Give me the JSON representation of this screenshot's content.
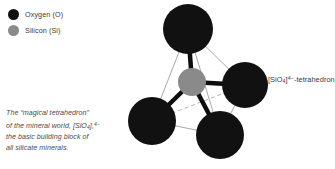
{
  "legend": {
    "items": [
      {
        "label": "Oxygen (O)",
        "color": "#111111",
        "icon": "circle-icon"
      },
      {
        "label": "Silicon (Si)",
        "color": "#8a8a8a",
        "icon": "circle-icon"
      }
    ]
  },
  "caption": {
    "line1": "The “magical tetrahedron”",
    "line2_pre": "of the mineral world, [SiO",
    "line2_sub": "4",
    "line2_sup": "4−",
    "line2_post": "],",
    "line3": "the basic building block of",
    "line4": "all silicate minerals."
  },
  "right_label": {
    "pre": "[SiO",
    "sub": "4",
    "sup": "4−",
    "post": "]-tetrahedron"
  },
  "diagram": {
    "background": "#ffffff",
    "oxygen_color": "#111111",
    "silicon_color": "#8a8a8a",
    "bond_color": "#0d0d0d",
    "edge_color": "#a9a9a9",
    "atoms": [
      {
        "name": "oxygen-top",
        "element": "O",
        "cx": 188,
        "cy": 29,
        "r": 25
      },
      {
        "name": "oxygen-right",
        "element": "O",
        "cx": 245,
        "cy": 85,
        "r": 23
      },
      {
        "name": "oxygen-bottom",
        "element": "O",
        "cx": 220,
        "cy": 135,
        "r": 24
      },
      {
        "name": "oxygen-lower-left",
        "element": "O",
        "cx": 152,
        "cy": 121,
        "r": 24
      },
      {
        "name": "silicon-center",
        "element": "Si",
        "cx": 192,
        "cy": 82,
        "r": 14
      }
    ]
  }
}
